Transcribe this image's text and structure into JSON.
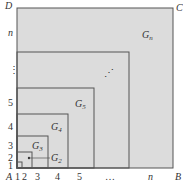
{
  "diagram": {
    "type": "nested-squares",
    "corners": {
      "top_left": "D",
      "top_right": "C",
      "bottom_left": "A",
      "bottom_right": "B"
    },
    "x_axis_ticks": [
      "1",
      "2",
      "3",
      "4",
      "5",
      "…",
      "n"
    ],
    "y_axis_ticks": [
      "1",
      "2",
      "3",
      "4",
      "5",
      "⋮",
      "n"
    ],
    "regions": [
      {
        "id": "G2",
        "label": "G",
        "sub": "2"
      },
      {
        "id": "G3",
        "label": "G",
        "sub": "3"
      },
      {
        "id": "G4",
        "label": "G",
        "sub": "4"
      },
      {
        "id": "G5",
        "label": "G",
        "sub": "5"
      },
      {
        "id": "Gn",
        "label": "G",
        "sub": "n"
      }
    ],
    "interior_ellipsis": "⋰",
    "fill_color": "#dcdcdc",
    "line_color": "#555555"
  }
}
